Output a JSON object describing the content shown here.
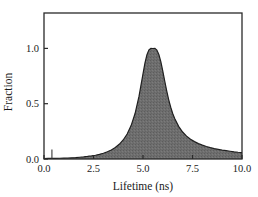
{
  "chart_data": {
    "type": "area",
    "title": "",
    "subtitle": "",
    "xlabel": "Lifetime (ns)",
    "ylabel": "Fraction",
    "xlim": [
      0.0,
      10.0
    ],
    "ylim": [
      0.0,
      1.32
    ],
    "xticks": [
      0.0,
      2.5,
      5.0,
      7.5,
      10.0
    ],
    "xtick_labels": [
      "0.0",
      "2.5",
      "5.0",
      "7.5",
      "10.0"
    ],
    "yticks": [
      0.0,
      0.5,
      1.0
    ],
    "ytick_labels": [
      "0.0",
      "0.5",
      "1.0"
    ],
    "grid": false,
    "legend": null,
    "legend_position": "none",
    "frame": "box",
    "series": [
      {
        "name": "Lifetime distribution",
        "fill_color": "#6e6e6e",
        "line_color": "#1f1f1f",
        "x": [
          0.0,
          0.2,
          0.4,
          0.6,
          0.8,
          1.0,
          1.2,
          1.4,
          1.6,
          1.8,
          2.0,
          2.2,
          2.4,
          2.6,
          2.8,
          3.0,
          3.2,
          3.4,
          3.6,
          3.8,
          4.0,
          4.2,
          4.4,
          4.6,
          4.8,
          5.0,
          5.1,
          5.2,
          5.3,
          5.4,
          5.5,
          5.6,
          5.7,
          5.8,
          5.9,
          6.0,
          6.1,
          6.2,
          6.3,
          6.4,
          6.5,
          6.6,
          6.8,
          7.0,
          7.2,
          7.4,
          7.6,
          7.8,
          8.0,
          8.2,
          8.4,
          8.6,
          8.8,
          9.0,
          9.2,
          9.4,
          9.6,
          9.8,
          10.0
        ],
        "y": [
          0.004,
          0.005,
          0.006,
          0.006,
          0.007,
          0.008,
          0.009,
          0.011,
          0.013,
          0.016,
          0.019,
          0.023,
          0.028,
          0.034,
          0.042,
          0.052,
          0.065,
          0.082,
          0.104,
          0.133,
          0.172,
          0.226,
          0.302,
          0.411,
          0.568,
          0.77,
          0.868,
          0.944,
          0.987,
          1.0,
          0.999,
          1.0,
          0.985,
          0.945,
          0.88,
          0.795,
          0.703,
          0.614,
          0.535,
          0.468,
          0.412,
          0.366,
          0.295,
          0.244,
          0.207,
          0.179,
          0.157,
          0.139,
          0.125,
          0.113,
          0.103,
          0.094,
          0.087,
          0.08,
          0.075,
          0.07,
          0.065,
          0.061,
          0.058
        ],
        "peak_x": 5.55,
        "peak_y": 1.0
      },
      {
        "name": "origin spike marker",
        "x": [
          0.4
        ],
        "y": [
          0.085
        ],
        "line_color": "#3a3a3a"
      }
    ]
  },
  "axes": {
    "xlabel": "Lifetime (ns)",
    "ylabel": "Fraction",
    "xtick_labels": [
      "0.0",
      "2.5",
      "5.0",
      "7.5",
      "10.0"
    ],
    "ytick_labels": [
      "0.0",
      "0.5",
      "1.0"
    ]
  },
  "colors": {
    "background": "#ffffff",
    "frame": "#2a2a2a",
    "fill": "#6e6e6e",
    "curve": "#1f1f1f",
    "text": "#1a1a1a"
  }
}
